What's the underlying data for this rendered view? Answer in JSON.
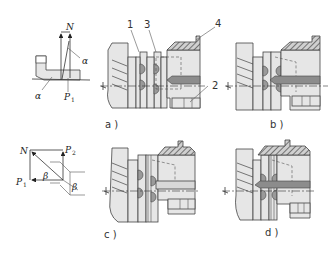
{
  "figure": {
    "type": "mechanical-drawing",
    "force_diagrams": {
      "top": {
        "labels": {
          "force_normal": "N",
          "force_p": "P",
          "force_p_sub": "1",
          "angle_upper": "α",
          "angle_lower": "α"
        }
      },
      "bottom": {
        "labels": {
          "force_normal": "N",
          "force_p1": "P",
          "force_p1_sub": "1",
          "force_p2": "P",
          "force_p2_sub": "2",
          "angle_inner": "β",
          "angle_outer": "β"
        }
      }
    },
    "panels": [
      {
        "id": "a",
        "caption": "a )"
      },
      {
        "id": "b",
        "caption": "b )"
      },
      {
        "id": "c",
        "caption": "c )"
      },
      {
        "id": "d",
        "caption": "d )"
      }
    ],
    "part_callouts": [
      {
        "number": "1"
      },
      {
        "number": "3"
      },
      {
        "number": "4"
      },
      {
        "number": "2"
      }
    ]
  }
}
